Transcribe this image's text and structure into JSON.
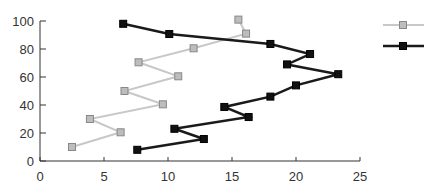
{
  "chart_data": {
    "type": "line",
    "title": "",
    "xlabel": "",
    "ylabel": "",
    "xlim": [
      0,
      25
    ],
    "ylim": [
      0,
      100
    ],
    "xticks": [
      0,
      5,
      10,
      15,
      20,
      25
    ],
    "yticks": [
      0,
      20,
      40,
      60,
      80,
      100
    ],
    "grid": false,
    "legend_position": "top-right",
    "series": [
      {
        "name": "",
        "color": "#c8c8c8",
        "marker_fill": "#bdbdbd",
        "marker": "square",
        "points": [
          [
            2.5,
            10
          ],
          [
            6.3,
            20.5
          ],
          [
            3.9,
            30
          ],
          [
            9.6,
            40.5
          ],
          [
            6.6,
            50
          ],
          [
            10.8,
            60.5
          ],
          [
            7.7,
            70.5
          ],
          [
            12.0,
            80.5
          ],
          [
            16.1,
            91
          ],
          [
            15.5,
            101
          ]
        ]
      },
      {
        "name": "",
        "color": "#1a1a1a",
        "marker_fill": "#111111",
        "marker": "square",
        "points": [
          [
            7.6,
            8
          ],
          [
            12.8,
            15.7
          ],
          [
            10.5,
            23
          ],
          [
            16.3,
            31.4
          ],
          [
            14.4,
            38.6
          ],
          [
            18.0,
            46
          ],
          [
            20.0,
            54
          ],
          [
            23.3,
            62
          ],
          [
            19.3,
            69
          ],
          [
            21.1,
            76.4
          ],
          [
            18.0,
            83.6
          ],
          [
            10.1,
            90.7
          ],
          [
            6.5,
            98
          ]
        ]
      }
    ]
  },
  "axis": {
    "x_tick_labels": [
      "0",
      "5",
      "10",
      "15",
      "20",
      "25"
    ],
    "y_tick_labels": [
      "0",
      "20",
      "40",
      "60",
      "80",
      "100"
    ]
  }
}
